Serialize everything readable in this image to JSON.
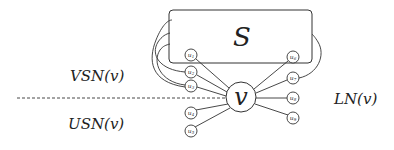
{
  "diagram": {
    "set_label": "S",
    "center_label": "v",
    "labels": {
      "vsn": "VSN(v)",
      "usn": "USN(v)",
      "ln": "LN(v)"
    },
    "nodes": [
      {
        "id": "u1",
        "text": "u",
        "sub": "1"
      },
      {
        "id": "u2",
        "text": "u",
        "sub": "2"
      },
      {
        "id": "u3",
        "text": "u",
        "sub": "3"
      },
      {
        "id": "u4",
        "text": "u",
        "sub": "4"
      },
      {
        "id": "u5",
        "text": "u",
        "sub": "5"
      },
      {
        "id": "u6",
        "text": "u",
        "sub": "6"
      },
      {
        "id": "u7",
        "text": "u",
        "sub": "7"
      },
      {
        "id": "u8",
        "text": "u",
        "sub": "8"
      },
      {
        "id": "u9",
        "text": "u",
        "sub": "9"
      }
    ],
    "stroke_color": "#333333",
    "background": "#ffffff"
  }
}
